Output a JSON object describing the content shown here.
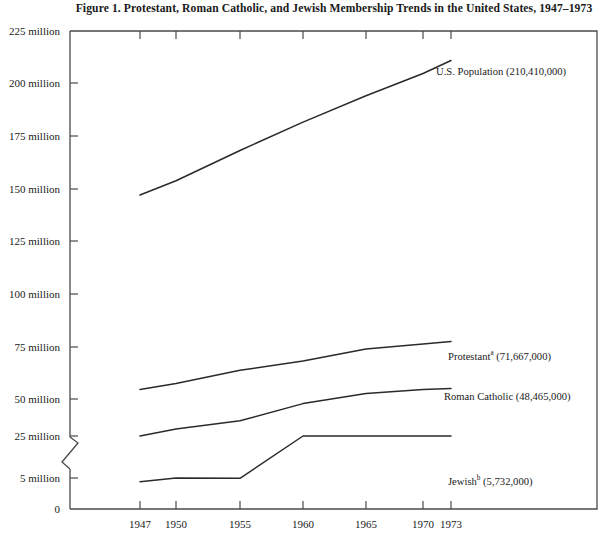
{
  "figure": {
    "title": "Figure 1. Protestant, Roman Catholic, and Jewish Membership Trends in the United States, 1947–1973"
  },
  "axes": {
    "y_ticks": [
      {
        "label": "225 million",
        "value": 225
      },
      {
        "label": "200 million",
        "value": 200
      },
      {
        "label": "175 million",
        "value": 175
      },
      {
        "label": "150 million",
        "value": 150
      },
      {
        "label": "125 million",
        "value": 125
      },
      {
        "label": "100 million",
        "value": 100
      },
      {
        "label": "75 million",
        "value": 75
      },
      {
        "label": "50 million",
        "value": 50
      },
      {
        "label": "25 million",
        "value": 25
      },
      {
        "label": "5 million",
        "value": 5
      },
      {
        "label": "0",
        "value": 0
      }
    ],
    "x_ticks": [
      {
        "label": "1947",
        "value": 1947
      },
      {
        "label": "1950",
        "value": 1950
      },
      {
        "label": "1955",
        "value": 1955
      },
      {
        "label": "1960",
        "value": 1960
      },
      {
        "label": "1965",
        "value": 1965
      },
      {
        "label": "1970",
        "value": 1970
      },
      {
        "label": "1973",
        "value": 1973
      }
    ],
    "has_axis_break": true,
    "axis_break_between": [
      25,
      5
    ]
  },
  "series_labels": {
    "us_population": "U.S. Population (210,410,000)",
    "protestant_name": "Protestant",
    "protestant_sup": "a",
    "protestant_value": " (71,667,000)",
    "roman_catholic": "Roman Catholic (48,465,000)",
    "jewish_name": "Jewish",
    "jewish_sup": "b",
    "jewish_value": " (5,732,000)"
  },
  "chart_data": {
    "type": "line",
    "title": "Figure 1. Protestant, Roman Catholic, and Jewish Membership Trends in the United States, 1947–1973",
    "xlabel": "",
    "ylabel": "",
    "x": [
      1947,
      1950,
      1955,
      1960,
      1965,
      1970,
      1973
    ],
    "xlim": [
      1946,
      1974.5
    ],
    "ylim": [
      0,
      225
    ],
    "grid": false,
    "legend_position": "right-inline",
    "axis_note": "Y axis is broken between 25 million and 5 million",
    "series": [
      {
        "name": "U.S. Population",
        "label": "U.S. Population (210,410,000)",
        "final_value": 210410000,
        "values": [
          144000000,
          151000000,
          166000000,
          180000000,
          193000000,
          204000000,
          210410000
        ],
        "values_millions": [
          144,
          151,
          166,
          180,
          193,
          204,
          210.41
        ]
      },
      {
        "name": "Protestant",
        "label": "Protestantᵃ (71,667,000)",
        "footnote_marker": "a",
        "final_value": 71667000,
        "values": [
          48000000,
          51000000,
          57500000,
          62000000,
          68000000,
          70500000,
          71667000
        ],
        "values_millions": [
          48,
          51,
          57.5,
          62,
          68,
          70.5,
          71.667
        ]
      },
      {
        "name": "Roman Catholic",
        "label": "Roman Catholic (48,465,000)",
        "final_value": 48465000,
        "values": [
          25000000,
          28500000,
          32500000,
          41000000,
          46000000,
          48000000,
          48465000
        ],
        "values_millions": [
          25,
          28.5,
          32.5,
          41,
          46,
          48,
          48.465
        ]
      },
      {
        "name": "Jewish",
        "label": "Jewishᵇ (5,732,000)",
        "footnote_marker": "b",
        "final_value": 5732000,
        "values": [
          4400000,
          5000000,
          4950000,
          5250000,
          5600000,
          5800000,
          5732000
        ],
        "values_millions": [
          4.4,
          5.0,
          4.95,
          5.25,
          5.6,
          5.8,
          5.732
        ]
      }
    ]
  },
  "colors": {
    "line": "#2a2a2a",
    "axis": "#444444",
    "text": "#1a1a1a",
    "background": "#ffffff"
  }
}
